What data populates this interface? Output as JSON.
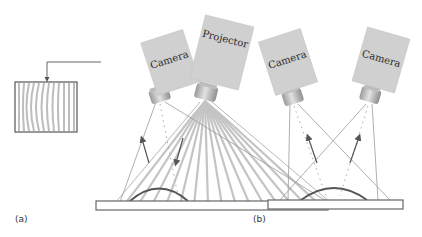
{
  "diagram": {
    "panels": [
      {
        "id": "a",
        "label": "(a)",
        "devices": [
          {
            "type": "camera",
            "label": "Camera"
          },
          {
            "type": "projector",
            "label": "Projector"
          }
        ],
        "inset": "captured fringe pattern image"
      },
      {
        "id": "b",
        "label": "(b)",
        "devices": [
          {
            "type": "camera",
            "label": "Camera"
          },
          {
            "type": "camera",
            "label": "Camera"
          }
        ]
      }
    ],
    "colors": {
      "device_fill": "#cfcfcf",
      "line": "#8a8a8a",
      "object_stroke": "#555555",
      "fringe": "#bdbdbd"
    }
  }
}
